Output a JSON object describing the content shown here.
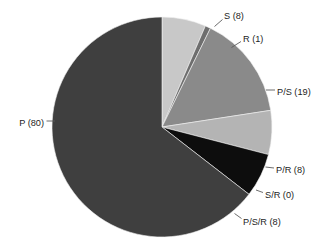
{
  "chart_data": {
    "type": "pie",
    "title": "",
    "subtitle": "",
    "xlabel": "",
    "ylabel": "",
    "legend_position": "none",
    "grid": false,
    "labels_position": "outside-with-leader-lines",
    "total": 124,
    "categories": [
      "S",
      "R",
      "P/S",
      "S/R",
      "P/R",
      "P/S/R",
      "P"
    ],
    "values": [
      8,
      1,
      19,
      0,
      8,
      8,
      80
    ],
    "slices": [
      {
        "name": "S",
        "label": "S (8)",
        "value": 8,
        "color": "#c8c8c8",
        "start_angle": 0.0,
        "end_angle": 23.23,
        "label_x": 224,
        "label_y": 17,
        "label_anchor": "start",
        "leader_x1": 214.5,
        "leader_y1": 26.5,
        "leader_x2": 222.5,
        "leader_y2": 19.5
      },
      {
        "name": "R",
        "label": "R (1)",
        "value": 1,
        "color": "#6e6e6e",
        "start_angle": 23.23,
        "end_angle": 26.13,
        "label_x": 243,
        "label_y": 40,
        "label_anchor": "start",
        "leader_x1": 231.5,
        "leader_y1": 47.5,
        "leader_x2": 241.0,
        "leader_y2": 41.5
      },
      {
        "name": "P/S",
        "label": "P/S (19)",
        "value": 19,
        "color": "#8a8a8a",
        "start_angle": 26.13,
        "end_angle": 81.29,
        "label_x": 277,
        "label_y": 93,
        "label_anchor": "start",
        "leader_x1": 266.0,
        "leader_y1": 90.0,
        "leader_x2": 275.0,
        "leader_y2": 90.0
      },
      {
        "name": "S/R",
        "label": "S/R (0)",
        "value": 0,
        "color": "#a5a5a5",
        "start_angle": 81.29,
        "end_angle": 81.29,
        "label_x": 265,
        "label_y": 196,
        "label_anchor": "start",
        "leader_x1": 256.0,
        "leader_y1": 190.0,
        "leader_x2": 263.0,
        "leader_y2": 192.5
      },
      {
        "name": "P/R",
        "label": "P/R (8)",
        "value": 8,
        "color": "#b4b4b4",
        "start_angle": 81.29,
        "end_angle": 104.52,
        "label_x": 276,
        "label_y": 171,
        "label_anchor": "start",
        "leader_x1": 265.5,
        "leader_y1": 167.0,
        "leader_x2": 274.0,
        "leader_y2": 168.0
      },
      {
        "name": "P/S/R",
        "label": "P/S/R (8)",
        "value": 8,
        "color": "#0d0d0d",
        "start_angle": 104.52,
        "end_angle": 127.74,
        "label_x": 243,
        "label_y": 223,
        "label_anchor": "start",
        "leader_x1": 234.5,
        "leader_y1": 213.5,
        "leader_x2": 241.5,
        "leader_y2": 218.5
      },
      {
        "name": "P",
        "label": "P (80)",
        "value": 80,
        "color": "#3f3f3f",
        "start_angle": 127.74,
        "end_angle": 360.0,
        "label_x": 44,
        "label_y": 124,
        "label_anchor": "end",
        "leader_x1": 46.5,
        "leader_y1": 121.0,
        "leader_x2": 55.0,
        "leader_y2": 121.0
      }
    ],
    "geometry": {
      "center_x": 162,
      "center_y": 127,
      "radius": 110,
      "start_angle_offset": -90,
      "direction": "clockwise"
    },
    "background_color": "#ffffff",
    "label_color": "#1d1d1d",
    "leader_color": "#5c5c5c"
  }
}
